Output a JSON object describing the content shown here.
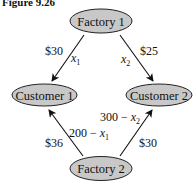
{
  "figure": {
    "title": "Figure 9.26"
  },
  "nodes": {
    "factory1": {
      "label": "Factory 1"
    },
    "factory2": {
      "label": "Factory 2"
    },
    "customer1": {
      "label": "Customer 1"
    },
    "customer2": {
      "label": "Customer 2"
    }
  },
  "edges": {
    "f1_c1": {
      "cost": "$30",
      "flow_var": "x",
      "flow_sub": "1"
    },
    "f1_c2": {
      "cost": "$25",
      "flow_var": "x",
      "flow_sub": "2"
    },
    "f2_c1": {
      "cost": "$36",
      "flow_prefix": "200 − ",
      "flow_var": "x",
      "flow_sub": "1"
    },
    "f2_c2": {
      "cost": "$30",
      "flow_prefix": "300 − ",
      "flow_var": "x",
      "flow_sub": "2"
    }
  },
  "colors": {
    "node_fill": "#c8c8c8",
    "stroke": "#222222"
  }
}
